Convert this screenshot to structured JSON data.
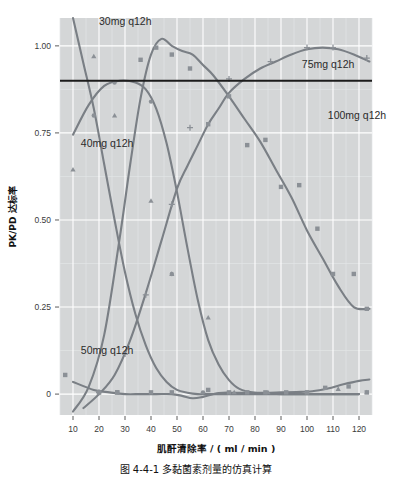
{
  "figure": {
    "caption": "图 4-4-1  多黏菌素剂量的仿真计算",
    "panel_color": "#d4d6d7",
    "curve_color": "#7a7f85",
    "threshold_color": "#1c1c1c",
    "marker_color": "#8b9096"
  },
  "chart_data": {
    "type": "line",
    "title": "",
    "xlabel": "肌酐清除率 / ( ml / min )",
    "ylabel": "PK/PD 达标率",
    "xlim": [
      5,
      125
    ],
    "ylim": [
      -0.06,
      1.08
    ],
    "xticks": [
      10,
      20,
      30,
      40,
      50,
      60,
      70,
      80,
      90,
      100,
      110,
      120
    ],
    "xtick_labels": [
      "10",
      "20",
      "30",
      "40",
      "50",
      "60",
      "70",
      "80",
      "90",
      "100",
      "110",
      "120"
    ],
    "yticks": [
      0,
      0.25,
      0.5,
      0.75,
      1.0
    ],
    "ytick_labels": [
      "0",
      "0.25",
      "0.50",
      "0.75",
      "1.00"
    ],
    "grid": true,
    "legend_position": "inline-annotations",
    "annotations": [
      {
        "text": "30mg q12h",
        "x": 20,
        "y": 1.06
      },
      {
        "text": "40mg q12h",
        "x": 13,
        "y": 0.71
      },
      {
        "text": "50mg q12h",
        "x": 13,
        "y": 0.115
      },
      {
        "text": "75mg q12h",
        "x": 98,
        "y": 0.935
      },
      {
        "text": "100mg q12h",
        "x": 108,
        "y": 0.79
      }
    ],
    "threshold": {
      "value": 0.9,
      "label": "target attainment threshold"
    },
    "series": [
      {
        "name": "30mg q12h",
        "marker": "triangle",
        "x": [
          10,
          14,
          18,
          22,
          26,
          30,
          34,
          38,
          42,
          46,
          50,
          54,
          58,
          62,
          70,
          80,
          90,
          100,
          110,
          120
        ],
        "values": [
          1.08,
          0.95,
          0.82,
          0.66,
          0.5,
          0.35,
          0.23,
          0.14,
          0.075,
          0.035,
          0.012,
          0.004,
          0.0,
          0.0,
          0.0,
          0.0,
          0.0,
          0.0,
          0.0,
          0.0
        ],
        "points_x": [
          10,
          18,
          26,
          40,
          48,
          62,
          72,
          85,
          100,
          112,
          123
        ],
        "points_y": [
          0.645,
          0.97,
          0.8,
          0.555,
          0.345,
          0.22,
          0.005,
          0.005,
          0.005,
          0.015,
          0.005
        ]
      },
      {
        "name": "40mg q12h",
        "marker": "circle",
        "x": [
          10,
          16,
          22,
          28,
          34,
          38,
          42,
          46,
          50,
          54,
          58,
          62,
          66,
          70,
          74,
          80,
          90,
          100,
          110,
          120
        ],
        "values": [
          0.745,
          0.83,
          0.885,
          0.9,
          0.895,
          0.875,
          0.82,
          0.72,
          0.58,
          0.42,
          0.27,
          0.155,
          0.085,
          0.04,
          0.015,
          0.004,
          0.0,
          0.0,
          0.0,
          0.0
        ],
        "points_x": [
          18,
          26,
          40,
          48,
          60
        ],
        "points_y": [
          0.8,
          0.895,
          0.84,
          0.345,
          0.005
        ]
      },
      {
        "name": "50mg q12h",
        "marker": "square",
        "x": [
          10,
          16,
          22,
          28,
          32,
          36,
          40,
          44,
          48,
          52,
          56,
          60,
          64,
          70,
          76,
          82,
          88,
          94,
          100,
          106,
          112,
          118,
          124
        ],
        "values": [
          -0.05,
          0.02,
          0.17,
          0.45,
          0.66,
          0.85,
          0.975,
          1.02,
          1.0,
          0.985,
          0.975,
          0.945,
          0.915,
          0.855,
          0.79,
          0.725,
          0.645,
          0.565,
          0.47,
          0.39,
          0.31,
          0.25,
          0.245
        ],
        "points_x": [
          7,
          20,
          27,
          36,
          42,
          48,
          55,
          62,
          70,
          77,
          84,
          90,
          97,
          104,
          110,
          118,
          123
        ],
        "points_y": [
          0.055,
          0.005,
          0.005,
          0.96,
          0.995,
          0.975,
          0.935,
          0.775,
          0.855,
          0.715,
          0.73,
          0.595,
          0.6,
          0.475,
          0.345,
          0.345,
          0.245
        ]
      },
      {
        "name": "75mg q12h",
        "marker": "plus",
        "x": [
          14,
          20,
          26,
          32,
          38,
          44,
          50,
          54,
          58,
          62,
          66,
          70,
          76,
          82,
          88,
          94,
          100,
          106,
          112,
          118,
          124
        ],
        "values": [
          -0.04,
          0.0,
          0.055,
          0.155,
          0.29,
          0.44,
          0.59,
          0.655,
          0.715,
          0.775,
          0.82,
          0.865,
          0.905,
          0.935,
          0.955,
          0.975,
          0.99,
          0.995,
          0.99,
          0.975,
          0.955
        ],
        "points_x": [
          20,
          30,
          38,
          48,
          55,
          70,
          86,
          100,
          110,
          123
        ],
        "points_y": [
          0.005,
          0.115,
          0.285,
          0.545,
          0.765,
          0.905,
          0.955,
          0.995,
          0.995,
          0.965
        ]
      },
      {
        "name": "100mg q12h",
        "marker": "square",
        "x": [
          10,
          18,
          24,
          30,
          36,
          42,
          48,
          52,
          56,
          60,
          66,
          72,
          78,
          84,
          90,
          96,
          102,
          108,
          114,
          120,
          124
        ],
        "values": [
          0.035,
          0.012,
          0.005,
          0.0,
          0.0,
          0.0,
          0.0,
          -0.005,
          -0.012,
          -0.008,
          0.003,
          0.004,
          0.004,
          0.004,
          0.005,
          0.006,
          0.008,
          0.016,
          0.028,
          0.038,
          0.042
        ],
        "points_x": [
          20,
          27,
          40,
          48,
          62,
          70,
          77,
          84,
          92,
          100,
          107,
          116,
          123
        ],
        "points_y": [
          0.005,
          0.005,
          0.005,
          0.005,
          0.012,
          0.005,
          0.005,
          0.005,
          0.005,
          0.005,
          0.018,
          0.022,
          0.005
        ]
      }
    ]
  }
}
